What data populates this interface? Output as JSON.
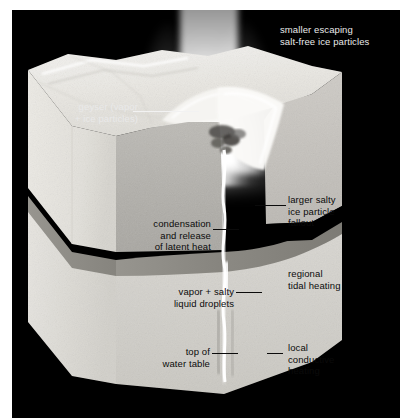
{
  "figure": {
    "background_color": "#000000",
    "paper_color": "#ffffff",
    "label_text_color_dark": "#0b0b0b",
    "label_text_color_light": "#e9e9e9"
  },
  "labels": {
    "smaller_escaping": "smaller escaping\nsalt-free ice particles",
    "geyser": "geyser (vapor\n+ ice particles)",
    "condensation": "condensation\nand release\nof latent heat",
    "larger_salty": "larger salty\nice particle\nfallout",
    "vapor_salty": "vapor + salty\nliquid droplets",
    "regional_tidal": "regional\ntidal heating",
    "top_water_table": "top of\nwater table",
    "local_conductive": "local\nconductive\nheating"
  },
  "scene": {
    "plume_name": "geyser-plume",
    "vent_name": "surface-vent",
    "conduit_name": "fracture-conduit",
    "water_table_name": "water-table-band",
    "block_name": "ice-crust-block",
    "colors": {
      "ice_top": "#eceae6",
      "ice_left_face": "#e3e1dc",
      "ice_right_face": "#c9c7c2",
      "ice_lower_light": "#d8d6d1",
      "water_table": "#8f8d88",
      "crack_bright": "#ffffff",
      "fallout_drift": "#f7f6f3"
    }
  }
}
